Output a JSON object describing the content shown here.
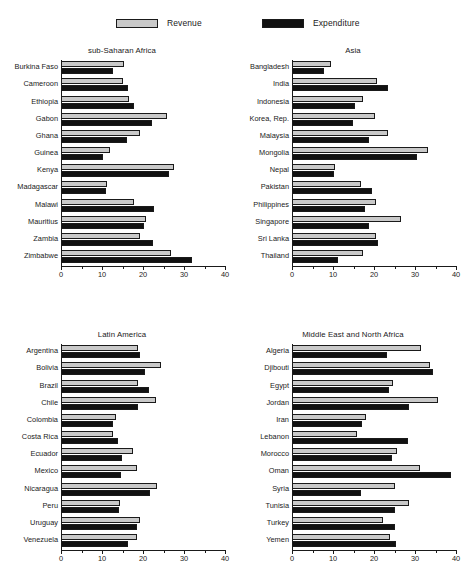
{
  "legend": {
    "items": [
      {
        "key": "revenue",
        "label": "Revenue",
        "color": "#c9c9c9"
      },
      {
        "key": "expenditure",
        "label": "Expenditure",
        "color": "#111111"
      }
    ]
  },
  "axis": {
    "ticks": [
      0,
      10,
      20,
      30,
      40
    ],
    "minor_ticks": [
      5,
      15,
      25,
      35
    ],
    "min": 0,
    "max": 40
  },
  "chart_data": [
    {
      "id": "ssa",
      "type": "bar",
      "orientation": "horizontal",
      "title": "sub-Saharan Africa",
      "xlabel": "",
      "ylabel": "",
      "xlim": [
        0,
        40
      ],
      "grid": false,
      "legend_position": "top",
      "categories": [
        "Burkina Faso",
        "Cameroon",
        "Ethiopia",
        "Gabon",
        "Ghana",
        "Guinea",
        "Kenya",
        "Madagascar",
        "Malawi",
        "Mauritius",
        "Zambia",
        "Zimbabwe"
      ],
      "series": [
        {
          "name": "Revenue",
          "values": [
            15.4,
            15.2,
            16.5,
            25.8,
            19.2,
            11.9,
            27.5,
            11.2,
            17.9,
            20.7,
            19.2,
            26.9
          ]
        },
        {
          "name": "Expenditure",
          "values": [
            12.7,
            16.3,
            17.9,
            22.3,
            16.0,
            10.3,
            26.3,
            11.0,
            22.8,
            20.3,
            22.4,
            32.0
          ]
        }
      ]
    },
    {
      "id": "asia",
      "type": "bar",
      "orientation": "horizontal",
      "title": "Asia",
      "xlabel": "",
      "ylabel": "",
      "xlim": [
        0,
        40
      ],
      "grid": false,
      "legend_position": "top",
      "categories": [
        "Bangladesh",
        "India",
        "Indonesia",
        "Korea, Rep.",
        "Malaysia",
        "Mongolia",
        "Nepal",
        "Pakistan",
        "Philippines",
        "Singapore",
        "Sri Lanka",
        "Thailand"
      ],
      "series": [
        {
          "name": "Revenue",
          "values": [
            9.4,
            20.7,
            17.3,
            20.3,
            23.3,
            33.2,
            10.5,
            16.9,
            20.4,
            26.5,
            20.4,
            17.3
          ]
        },
        {
          "name": "Expenditure",
          "values": [
            7.8,
            23.3,
            15.3,
            14.9,
            18.9,
            30.5,
            10.3,
            19.6,
            17.7,
            18.9,
            21.0,
            11.2
          ]
        }
      ]
    },
    {
      "id": "lam",
      "type": "bar",
      "orientation": "horizontal",
      "title": "Latin America",
      "xlabel": "",
      "ylabel": "",
      "xlim": [
        0,
        40
      ],
      "grid": false,
      "legend_position": "top",
      "categories": [
        "Argentina",
        "Bolivia",
        "Brazil",
        "Chile",
        "Colombia",
        "Costa Rica",
        "Ecuador",
        "Mexico",
        "Nicaragua",
        "Peru",
        "Uruguay",
        "Venezuela"
      ],
      "series": [
        {
          "name": "Revenue",
          "values": [
            18.9,
            24.4,
            18.9,
            23.1,
            13.4,
            12.6,
            17.5,
            18.6,
            23.4,
            14.3,
            19.3,
            18.6
          ]
        },
        {
          "name": "Expenditure",
          "values": [
            19.2,
            20.6,
            21.5,
            18.9,
            12.8,
            14.0,
            14.9,
            14.6,
            21.7,
            14.2,
            18.6,
            16.3
          ]
        }
      ]
    },
    {
      "id": "mena",
      "type": "bar",
      "orientation": "horizontal",
      "title": "Middle East and North Africa",
      "xlabel": "",
      "ylabel": "",
      "xlim": [
        0,
        40
      ],
      "grid": false,
      "legend_position": "top",
      "categories": [
        "Algeria",
        "Djibouti",
        "Egypt",
        "Jordan",
        "Iran",
        "Lebanon",
        "Morocco",
        "Oman",
        "Syria",
        "Tunisia",
        "Turkey",
        "Yemen"
      ],
      "series": [
        {
          "name": "Revenue",
          "values": [
            31.5,
            33.6,
            24.6,
            35.6,
            18.1,
            15.9,
            25.7,
            31.1,
            25.1,
            28.6,
            22.1,
            23.9
          ]
        },
        {
          "name": "Expenditure",
          "values": [
            23.2,
            34.3,
            23.7,
            28.5,
            17.1,
            28.4,
            24.4,
            38.7,
            16.8,
            25.0,
            25.0,
            25.3
          ]
        }
      ]
    }
  ]
}
